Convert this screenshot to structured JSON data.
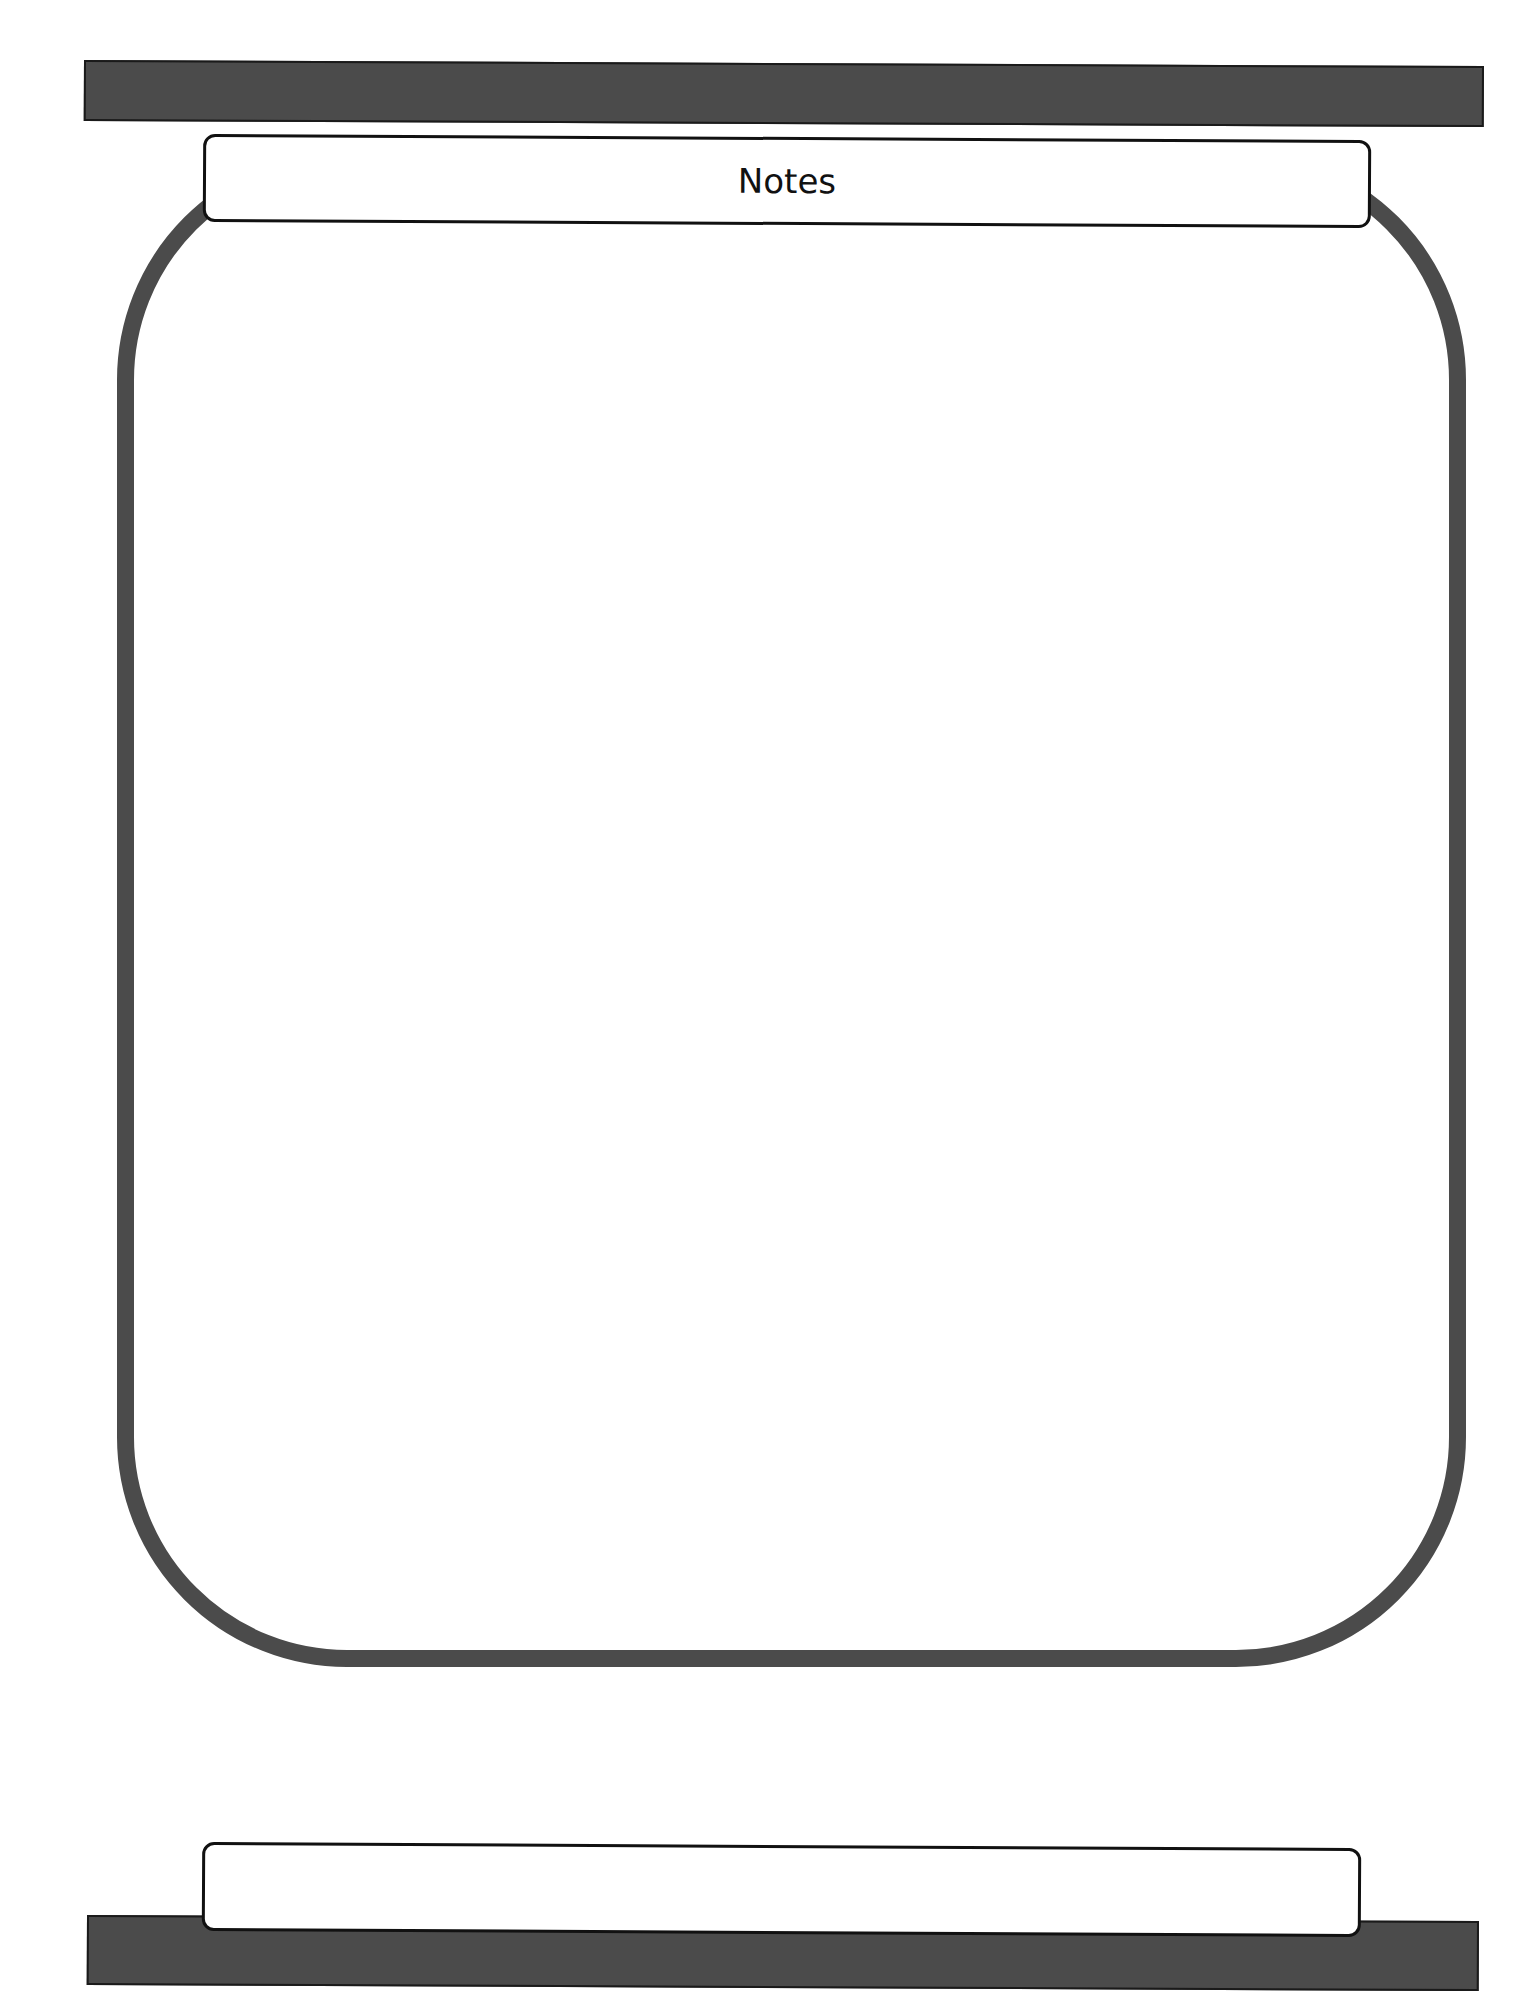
{
  "page": {
    "title": "Notes",
    "footer_label": "",
    "notes_content": ""
  },
  "colors": {
    "bar": "#4b4b4b",
    "jar_outline": "#4b4b4b",
    "label_border": "#111111",
    "background": "#ffffff"
  }
}
